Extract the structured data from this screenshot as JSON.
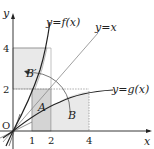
{
  "diagram": {
    "axes": {
      "x_label": "x",
      "y_label": "y",
      "origin_label": "O",
      "x_ticks": [
        "1",
        "2",
        "4"
      ],
      "y_ticks": [
        "2",
        "4"
      ]
    },
    "curves": [
      {
        "name": "f",
        "label": "y=f(x)"
      },
      {
        "name": "identity",
        "label": "y=x"
      },
      {
        "name": "g",
        "label": "y=g(x)"
      }
    ],
    "regions": [
      {
        "name": "A",
        "label": "A"
      },
      {
        "name": "B",
        "label": "B"
      },
      {
        "name": "B-prime",
        "label": "B′"
      }
    ],
    "colors": {
      "shade_light": "#e9e9e9",
      "shade_dark": "#d4d4d4",
      "line": "#222222",
      "thin_line": "#777777"
    }
  }
}
